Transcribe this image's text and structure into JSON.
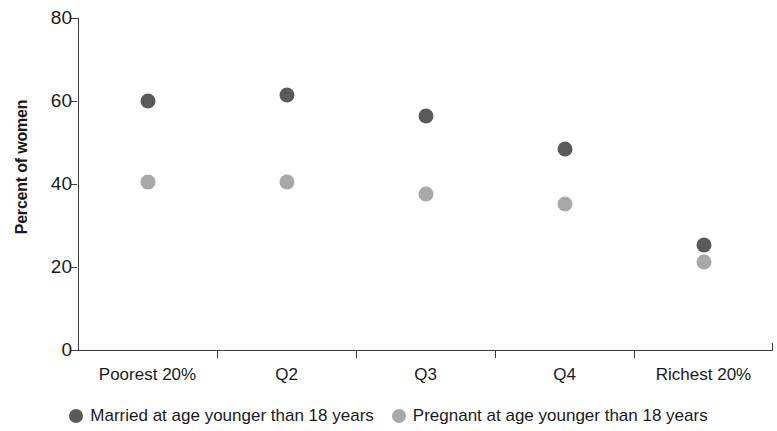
{
  "chart_data": {
    "type": "scatter",
    "title": "",
    "xlabel": "",
    "ylabel": "Percent of women",
    "ylim": [
      0,
      80
    ],
    "yticks": [
      0,
      20,
      40,
      60,
      80
    ],
    "grid": false,
    "legend_position": "bottom",
    "categories": [
      "Poorest 20%",
      "Q2",
      "Q3",
      "Q4",
      "Richest 20%"
    ],
    "series": [
      {
        "name": "Married at age younger than 18 years",
        "color": "#5a5a5a",
        "marker": "circle",
        "values": [
          59.9,
          61.4,
          56.4,
          48.4,
          25.2
        ]
      },
      {
        "name": "Pregnant at age younger than 18 years",
        "color": "#a8a8a8",
        "marker": "circle",
        "values": [
          40.4,
          40.4,
          37.7,
          35.1,
          21.2
        ]
      }
    ]
  },
  "axis": {
    "y_title": "Percent of women",
    "y_tick_labels": [
      "80",
      "60",
      "40",
      "20",
      "0"
    ]
  },
  "legend": {
    "items": [
      {
        "label": "Married at age younger than 18 years",
        "color": "#5a5a5a"
      },
      {
        "label": "Pregnant at age younger than 18 years",
        "color": "#a8a8a8"
      }
    ]
  }
}
